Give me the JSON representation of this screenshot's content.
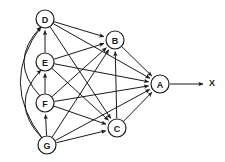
{
  "diagram": {
    "type": "directed-graph",
    "title": "",
    "canvas": {
      "width": 225,
      "height": 162
    },
    "background_color": "#ffffff",
    "stroke_color": "#1a1a1a",
    "node_fill_color": "#ffffff",
    "node_radius": 9,
    "nodes": [
      {
        "id": "A",
        "label": "A",
        "x": 160,
        "y": 84
      },
      {
        "id": "B",
        "label": "B",
        "x": 115,
        "y": 40
      },
      {
        "id": "C",
        "label": "C",
        "x": 117,
        "y": 128
      },
      {
        "id": "D",
        "label": "D",
        "x": 45,
        "y": 19
      },
      {
        "id": "E",
        "label": "E",
        "x": 45,
        "y": 62
      },
      {
        "id": "F",
        "label": "F",
        "x": 45,
        "y": 103
      },
      {
        "id": "G",
        "label": "G",
        "x": 47,
        "y": 145
      }
    ],
    "output": {
      "label": "X",
      "x": 212,
      "y": 83,
      "from_node": "A",
      "arrow_start_x": 170,
      "arrow_end_x": 203
    },
    "edges": [
      {
        "from": "D",
        "to": "B",
        "shape": "straight"
      },
      {
        "from": "D",
        "to": "A",
        "shape": "straight"
      },
      {
        "from": "D",
        "to": "C",
        "shape": "straight"
      },
      {
        "from": "E",
        "to": "D",
        "shape": "straight"
      },
      {
        "from": "E",
        "to": "B",
        "shape": "straight"
      },
      {
        "from": "E",
        "to": "A",
        "shape": "straight"
      },
      {
        "from": "E",
        "to": "C",
        "shape": "straight"
      },
      {
        "from": "F",
        "to": "E",
        "shape": "straight"
      },
      {
        "from": "F",
        "to": "D",
        "shape": "curved"
      },
      {
        "from": "F",
        "to": "B",
        "shape": "straight"
      },
      {
        "from": "F",
        "to": "A",
        "shape": "straight"
      },
      {
        "from": "F",
        "to": "C",
        "shape": "straight"
      },
      {
        "from": "G",
        "to": "F",
        "shape": "straight"
      },
      {
        "from": "G",
        "to": "E",
        "shape": "curved"
      },
      {
        "from": "G",
        "to": "D",
        "shape": "curved"
      },
      {
        "from": "G",
        "to": "B",
        "shape": "straight"
      },
      {
        "from": "G",
        "to": "A",
        "shape": "straight"
      },
      {
        "from": "G",
        "to": "C",
        "shape": "straight"
      },
      {
        "from": "C",
        "to": "B",
        "shape": "straight"
      },
      {
        "from": "C",
        "to": "A",
        "shape": "straight"
      },
      {
        "from": "B",
        "to": "A",
        "shape": "straight"
      }
    ]
  }
}
